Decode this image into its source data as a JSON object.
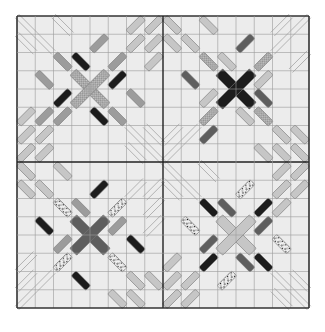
{
  "image": {
    "subject": "Quilt pattern of four star-like blocks with diagonal bar pieces",
    "background": "#ffffff"
  },
  "quilt": {
    "x": 17,
    "y": 16,
    "size": 292,
    "cell": 18.25,
    "grid": 16,
    "fabric": "#ececec",
    "grid_line": "#9a9a9a",
    "outer_border": "#333333",
    "divider": "#222222"
  },
  "colors": {
    "light": "#c6c6c6",
    "medium": "#9c9c9c",
    "dark": "#5e5e5e",
    "black": "#1c1c1c",
    "checked": "#b4b4b4",
    "speckled": "#e0e0e0",
    "line": "#a8a8a8"
  },
  "blocks": [
    {
      "name": "top-left",
      "ox": 0,
      "oy": 0,
      "center": {
        "color": "checked",
        "width": 9
      },
      "bars": [
        [
          4,
          1,
          "/",
          "medium"
        ],
        [
          2,
          2,
          "\\",
          "medium"
        ],
        [
          3,
          2,
          "\\",
          "black"
        ],
        [
          5,
          2,
          "/",
          "medium"
        ],
        [
          1,
          3,
          "\\",
          "medium"
        ],
        [
          5,
          3,
          "/",
          "black"
        ],
        [
          2,
          4,
          "/",
          "black"
        ],
        [
          6,
          4,
          "\\",
          "medium"
        ],
        [
          1,
          5,
          "/",
          "medium"
        ],
        [
          2,
          5,
          "/",
          "medium"
        ],
        [
          4,
          5,
          "\\",
          "black"
        ],
        [
          5,
          5,
          "\\",
          "medium"
        ],
        [
          6,
          0,
          "/",
          "light"
        ],
        [
          7,
          0,
          "/",
          "light"
        ],
        [
          6,
          1,
          "/",
          "light"
        ],
        [
          7,
          1,
          "/",
          "light"
        ],
        [
          7,
          2,
          "/",
          "light"
        ],
        [
          0,
          6,
          "/",
          "light"
        ],
        [
          1,
          6,
          "/",
          "light"
        ],
        [
          0,
          7,
          "/",
          "light"
        ],
        [
          1,
          7,
          "/",
          "light"
        ],
        [
          0,
          5,
          "/",
          "light"
        ],
        [
          0,
          0,
          "\\",
          "line"
        ],
        [
          2,
          0,
          "\\",
          "line"
        ],
        [
          0,
          1,
          "\\",
          "line"
        ],
        [
          1,
          1,
          "\\",
          "line"
        ],
        [
          6,
          6,
          "\\",
          "line"
        ],
        [
          7,
          6,
          "\\",
          "line"
        ],
        [
          6,
          7,
          "\\",
          "line"
        ],
        [
          7,
          7,
          "\\",
          "line"
        ]
      ]
    },
    {
      "name": "top-right",
      "ox": 8,
      "oy": 0,
      "center": {
        "color": "black",
        "width": 10
      },
      "bars": [
        [
          0,
          0,
          "\\",
          "light"
        ],
        [
          2,
          0,
          "\\",
          "light"
        ],
        [
          0,
          1,
          "\\",
          "light"
        ],
        [
          1,
          1,
          "\\",
          "light"
        ],
        [
          4,
          1,
          "/",
          "dark"
        ],
        [
          2,
          2,
          "\\",
          "checked"
        ],
        [
          3,
          2,
          "\\",
          "light"
        ],
        [
          5,
          2,
          "/",
          "checked"
        ],
        [
          1,
          3,
          "\\",
          "dark"
        ],
        [
          5,
          3,
          "/",
          "light"
        ],
        [
          2,
          4,
          "/",
          "light"
        ],
        [
          5,
          4,
          "\\",
          "dark"
        ],
        [
          2,
          5,
          "/",
          "checked"
        ],
        [
          4,
          5,
          "\\",
          "light"
        ],
        [
          5,
          5,
          "\\",
          "checked"
        ],
        [
          2,
          6,
          "/",
          "dark"
        ],
        [
          6,
          0,
          "/",
          "line"
        ],
        [
          7,
          0,
          "/",
          "line"
        ],
        [
          6,
          1,
          "/",
          "line"
        ],
        [
          7,
          2,
          "/",
          "line"
        ],
        [
          0,
          6,
          "/",
          "line"
        ],
        [
          1,
          6,
          "/",
          "line"
        ],
        [
          0,
          7,
          "/",
          "line"
        ],
        [
          6,
          6,
          "\\",
          "light"
        ],
        [
          7,
          6,
          "\\",
          "light"
        ],
        [
          6,
          7,
          "\\",
          "light"
        ],
        [
          7,
          7,
          "\\",
          "light"
        ],
        [
          5,
          7,
          "\\",
          "light"
        ]
      ]
    },
    {
      "name": "bottom-left",
      "ox": 0,
      "oy": 8,
      "center": {
        "color": "dark",
        "width": 10
      },
      "bars": [
        [
          0,
          0,
          "\\",
          "light"
        ],
        [
          2,
          0,
          "\\",
          "light"
        ],
        [
          0,
          1,
          "\\",
          "light"
        ],
        [
          1,
          1,
          "\\",
          "light"
        ],
        [
          4,
          1,
          "/",
          "black"
        ],
        [
          2,
          2,
          "\\",
          "speckled"
        ],
        [
          3,
          2,
          "\\",
          "medium"
        ],
        [
          5,
          2,
          "/",
          "speckled"
        ],
        [
          1,
          3,
          "\\",
          "black"
        ],
        [
          5,
          3,
          "/",
          "medium"
        ],
        [
          2,
          4,
          "/",
          "medium"
        ],
        [
          6,
          4,
          "\\",
          "black"
        ],
        [
          2,
          5,
          "/",
          "speckled"
        ],
        [
          5,
          5,
          "\\",
          "speckled"
        ],
        [
          3,
          6,
          "\\",
          "black"
        ],
        [
          6,
          1,
          "/",
          "line"
        ],
        [
          7,
          1,
          "/",
          "line"
        ],
        [
          7,
          2,
          "/",
          "line"
        ],
        [
          7,
          3,
          "/",
          "line"
        ],
        [
          0,
          5,
          "/",
          "line"
        ],
        [
          0,
          6,
          "/",
          "line"
        ],
        [
          1,
          6,
          "/",
          "line"
        ],
        [
          0,
          7,
          "/",
          "line"
        ],
        [
          6,
          6,
          "\\",
          "light"
        ],
        [
          7,
          6,
          "\\",
          "light"
        ],
        [
          6,
          7,
          "\\",
          "light"
        ],
        [
          5,
          7,
          "\\",
          "light"
        ]
      ]
    },
    {
      "name": "bottom-right",
      "ox": 8,
      "oy": 8,
      "center": {
        "color": "light",
        "width": 10
      },
      "bars": [
        [
          0,
          0,
          "\\",
          "line"
        ],
        [
          2,
          0,
          "\\",
          "line"
        ],
        [
          0,
          1,
          "\\",
          "line"
        ],
        [
          1,
          1,
          "\\",
          "line"
        ],
        [
          4,
          1,
          "/",
          "speckled"
        ],
        [
          2,
          2,
          "\\",
          "black"
        ],
        [
          3,
          2,
          "\\",
          "dark"
        ],
        [
          5,
          2,
          "/",
          "black"
        ],
        [
          1,
          3,
          "\\",
          "speckled"
        ],
        [
          5,
          3,
          "/",
          "dark"
        ],
        [
          2,
          4,
          "/",
          "dark"
        ],
        [
          6,
          4,
          "\\",
          "speckled"
        ],
        [
          2,
          5,
          "/",
          "black"
        ],
        [
          4,
          5,
          "\\",
          "dark"
        ],
        [
          5,
          5,
          "\\",
          "black"
        ],
        [
          3,
          6,
          "/",
          "speckled"
        ],
        [
          6,
          0,
          "/",
          "light"
        ],
        [
          7,
          0,
          "/",
          "light"
        ],
        [
          6,
          1,
          "/",
          "light"
        ],
        [
          7,
          1,
          "/",
          "light"
        ],
        [
          6,
          2,
          "/",
          "light"
        ],
        [
          0,
          5,
          "/",
          "light"
        ],
        [
          0,
          6,
          "/",
          "light"
        ],
        [
          1,
          6,
          "/",
          "light"
        ],
        [
          0,
          7,
          "/",
          "light"
        ],
        [
          1,
          7,
          "/",
          "light"
        ],
        [
          6,
          6,
          "\\",
          "line"
        ],
        [
          7,
          6,
          "\\",
          "line"
        ],
        [
          6,
          7,
          "\\",
          "line"
        ],
        [
          7,
          7,
          "\\",
          "line"
        ]
      ]
    }
  ]
}
